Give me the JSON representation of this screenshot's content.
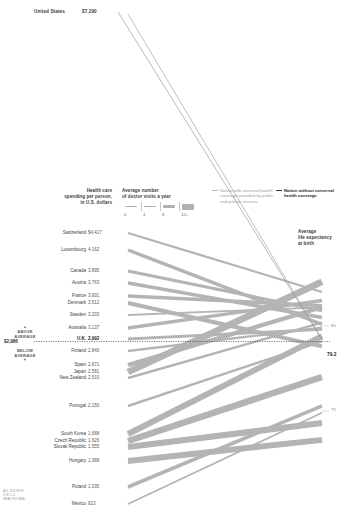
{
  "annotation": {
    "country": "United States",
    "value": "$7,290"
  },
  "headers": {
    "spending": "Health care\nspending per person,\nin U.S. dollars",
    "visits": "Average number\nof doctor visits a year",
    "life": "Average\nlife expectancy\nat birth"
  },
  "thickness_scale": {
    "ticks": [
      "0",
      "4",
      "8",
      "12+"
    ]
  },
  "legend": {
    "with_coverage": "Nation with universal health coverage provided by public and private insurers",
    "without_coverage": "Nation without universal health coverage",
    "with_color": "#b8b8b8",
    "without_color": "#3a3a3a"
  },
  "average_marker": {
    "above": "ABOVE\nAVERAGE",
    "below": "BELOW\nAVERAGE",
    "value": "$2,986"
  },
  "right_axis": {
    "ticks": [
      "80",
      "75"
    ],
    "us_value": "79.2"
  },
  "source_note": "ALL SOURCE:\nO.E.C.D.\nHEALTH DATA",
  "chart_data": {
    "type": "line",
    "xlabel": "",
    "ylabel": "Health care spending per person, in U.S. dollars",
    "left_axis": {
      "label": "spending_usd",
      "min": 700,
      "max": 7500
    },
    "right_axis": {
      "label": "life_expectancy_years",
      "min": 73.0,
      "max": 83.5,
      "ticks": [
        80,
        75
      ]
    },
    "line_width_encodes": "doctor_visits_per_year",
    "average_spending": 2986,
    "series": [
      {
        "name": "United States",
        "spending": 7290,
        "life_expectancy": 79.2,
        "doctor_visits": 3.9,
        "universal_coverage": false
      },
      {
        "name": "Switzerland",
        "spending": 4417,
        "life_expectancy": 82.0,
        "doctor_visits": 3.8,
        "universal_coverage": true
      },
      {
        "name": "Luxembourg",
        "spending": 4162,
        "life_expectancy": 80.1,
        "doctor_visits": 6.4,
        "universal_coverage": true
      },
      {
        "name": "Canada",
        "spending": 3895,
        "life_expectancy": 80.9,
        "doctor_visits": 5.8,
        "universal_coverage": true
      },
      {
        "name": "Austria",
        "spending": 3763,
        "life_expectancy": 80.5,
        "doctor_visits": 6.7,
        "universal_coverage": true
      },
      {
        "name": "France",
        "spending": 3601,
        "life_expectancy": 81.2,
        "doctor_visits": 6.3,
        "universal_coverage": true
      },
      {
        "name": "Denmark",
        "spending": 3512,
        "life_expectancy": 78.8,
        "doctor_visits": 7.5,
        "universal_coverage": true
      },
      {
        "name": "Sweden",
        "spending": 3203,
        "life_expectancy": 81.1,
        "doctor_visits": 2.8,
        "universal_coverage": true
      },
      {
        "name": "Australia",
        "spending": 3137,
        "life_expectancy": 81.5,
        "doctor_visits": 6.1,
        "universal_coverage": true
      },
      {
        "name": "U.K.",
        "spending": 2992,
        "life_expectancy": 79.8,
        "doctor_visits": 5.1,
        "universal_coverage": true
      },
      {
        "name": "Finland",
        "spending": 2840,
        "life_expectancy": 79.9,
        "doctor_visits": 4.2,
        "universal_coverage": true
      },
      {
        "name": "Spain",
        "spending": 2671,
        "life_expectancy": 81.1,
        "doctor_visits": 8.1,
        "universal_coverage": true
      },
      {
        "name": "Japan",
        "spending": 2581,
        "life_expectancy": 82.6,
        "doctor_visits": 13.6,
        "universal_coverage": true
      },
      {
        "name": "New Zealand",
        "spending": 2510,
        "life_expectancy": 80.2,
        "doctor_visits": 4.3,
        "universal_coverage": true
      },
      {
        "name": "Portugal",
        "spending": 2150,
        "life_expectancy": 79.1,
        "doctor_visits": 4.1,
        "universal_coverage": true
      },
      {
        "name": "South Korea",
        "spending": 1688,
        "life_expectancy": 79.4,
        "doctor_visits": 11.8,
        "universal_coverage": true
      },
      {
        "name": "Czech Republic",
        "spending": 1626,
        "life_expectancy": 77.0,
        "doctor_visits": 13.0,
        "universal_coverage": true
      },
      {
        "name": "Slovak Republic",
        "spending": 1555,
        "life_expectancy": 74.3,
        "doctor_visits": 12.0,
        "universal_coverage": true
      },
      {
        "name": "Hungary",
        "spending": 1388,
        "life_expectancy": 73.3,
        "doctor_visits": 11.8,
        "universal_coverage": true
      },
      {
        "name": "Poland",
        "spending": 1035,
        "life_expectancy": 75.3,
        "doctor_visits": 6.6,
        "universal_coverage": true
      },
      {
        "name": "Mexico",
        "spending": 823,
        "life_expectancy": 74.9,
        "doctor_visits": 2.5,
        "universal_coverage": true
      }
    ]
  },
  "rows": [
    {
      "name": "Switzerland",
      "value": "$4,417",
      "y": 233
    },
    {
      "name": "Luxembourg",
      "value": "4,162",
      "y": 250
    },
    {
      "name": "Canada",
      "value": "3,895",
      "y": 271
    },
    {
      "name": "Austria",
      "value": "3,763",
      "y": 283
    },
    {
      "name": "France",
      "value": "3,601",
      "y": 296
    },
    {
      "name": "Denmark",
      "value": "3,512",
      "y": 303
    },
    {
      "name": "Sweden",
      "value": "3,203",
      "y": 315
    },
    {
      "name": "Australia",
      "value": "3,137",
      "y": 328
    },
    {
      "name": "U.K.",
      "value": "2,992",
      "y": 339
    },
    {
      "name": "Finland",
      "value": "2,840",
      "y": 351
    },
    {
      "name": "Spain",
      "value": "2,671",
      "y": 365
    },
    {
      "name": "Japan",
      "value": "2,581",
      "y": 372
    },
    {
      "name": "New Zealand",
      "value": "2,510",
      "y": 378
    },
    {
      "name": "Portugal",
      "value": "2,150",
      "y": 406
    },
    {
      "name": "South Korea",
      "value": "1,688",
      "y": 434
    },
    {
      "name": "Czech Republic",
      "value": "1,626",
      "y": 441
    },
    {
      "name": "Slovak Republic",
      "value": "1,555",
      "y": 447
    },
    {
      "name": "Hungary",
      "value": "1,388",
      "y": 461
    },
    {
      "name": "Poland",
      "value": "1,035",
      "y": 487
    },
    {
      "name": "Mexico",
      "value": "823",
      "y": 504
    }
  ]
}
